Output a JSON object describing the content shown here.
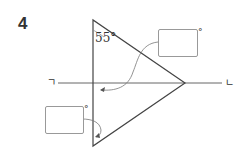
{
  "problem": {
    "number": "4"
  },
  "diagram": {
    "given_angle": "55°",
    "line_label_left": "ㄱ",
    "line_label_right": "ㄴ",
    "answer_boxes": [
      {
        "id": "top-right",
        "value": "",
        "unit": "°"
      },
      {
        "id": "bottom-left",
        "value": "",
        "unit": "°"
      }
    ]
  },
  "colors": {
    "line": "#555555",
    "box_border": "#999999",
    "text": "#333333"
  }
}
